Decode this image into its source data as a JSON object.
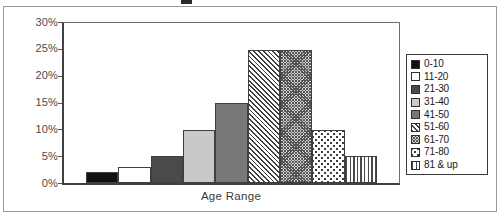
{
  "chart_data": {
    "type": "bar",
    "title": "",
    "xlabel": "Age Range",
    "ylabel": "",
    "categories": [
      "0-10",
      "11-20",
      "21-30",
      "31-40",
      "41-50",
      "51-60",
      "61-70",
      "71-80",
      "81 & up"
    ],
    "values": [
      2,
      3,
      5,
      10,
      15,
      25,
      25,
      10,
      5
    ],
    "value_unit": "%",
    "ylim": [
      0,
      30
    ],
    "ytick_labels": [
      "30%",
      "25%",
      "20%",
      "15%",
      "10%",
      "5%",
      "0%"
    ],
    "ytick_values": [
      30,
      25,
      20,
      15,
      10,
      5,
      0
    ],
    "xtick_labels": [],
    "grid": false,
    "legend_position": "right-outside",
    "legend": [
      {
        "label": "0-10",
        "fill": "solid-black",
        "pattern": "solid",
        "color": "#111111"
      },
      {
        "label": "11-20",
        "fill": "white",
        "pattern": "solid",
        "color": "#ffffff"
      },
      {
        "label": "21-30",
        "fill": "dark-gray",
        "pattern": "solid",
        "color": "#4a4a4a"
      },
      {
        "label": "31-40",
        "fill": "light-gray",
        "pattern": "solid",
        "color": "#c9c9c9"
      },
      {
        "label": "41-50",
        "fill": "mid-gray",
        "pattern": "solid",
        "color": "#787878"
      },
      {
        "label": "51-60",
        "fill": "diagonal-hatch",
        "pattern": "diagonal-lines",
        "color": "#3f3f3f"
      },
      {
        "label": "61-70",
        "fill": "crosshatch-dense",
        "pattern": "crosshatch",
        "color": "#555555"
      },
      {
        "label": "71-80",
        "fill": "dots",
        "pattern": "dotted",
        "color": "#3d3d3d"
      },
      {
        "label": "81 & up",
        "fill": "vertical-lines",
        "pattern": "vertical-lines",
        "color": "#4a4a4a"
      }
    ]
  },
  "figure": {
    "title_fragment": "",
    "axis_color": "#404040",
    "frame_color": "#9a9a9a",
    "background": "#ffffff"
  }
}
